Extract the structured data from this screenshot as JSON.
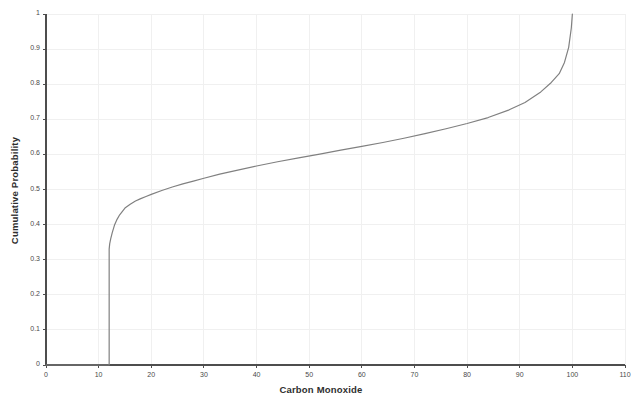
{
  "chart_data": {
    "type": "line",
    "title": "",
    "subtitle": "",
    "xlabel": "Carbon Monoxide",
    "ylabel": "Cumulative Probability",
    "xlim": [
      0,
      110
    ],
    "ylim": [
      0,
      1
    ],
    "xticks": [
      0,
      10,
      20,
      30,
      40,
      50,
      60,
      70,
      80,
      90,
      100,
      110
    ],
    "xticklabels": [
      "0",
      "10",
      "20",
      "30",
      "40",
      "50",
      "60",
      "70",
      "80",
      "90",
      "100",
      "110"
    ],
    "yticks": [
      0,
      0.1,
      0.2,
      0.3,
      0.4,
      0.5,
      0.6,
      0.7,
      0.8,
      0.9,
      1
    ],
    "yticklabels": [
      "0",
      "0.1",
      "0.2",
      "0.3",
      "0.4",
      "0.5",
      "0.6",
      "0.7",
      "0.8",
      "0.9",
      "1"
    ],
    "grid": true,
    "legend": false,
    "legend_position": "none",
    "line_color": "#808080",
    "grid_color": "#f0f0f0",
    "axis_color": "#4d4d4d",
    "background_color": "#ffffff",
    "series": [
      {
        "name": "Carbon Monoxide CDF",
        "x": [
          0,
          6,
          12,
          12,
          12.1,
          12.3,
          12.6,
          13,
          13.5,
          14,
          15,
          16,
          17,
          18,
          19,
          20,
          22,
          24,
          26,
          28,
          30,
          33,
          36,
          40,
          44,
          48,
          52,
          56,
          60,
          64,
          68,
          72,
          76,
          80,
          84,
          88,
          91,
          94,
          96,
          97.5,
          98.5,
          99.3,
          99.8,
          100
        ],
        "y": [
          0,
          0,
          0,
          0.33,
          0.345,
          0.36,
          0.378,
          0.398,
          0.415,
          0.428,
          0.447,
          0.458,
          0.467,
          0.474,
          0.48,
          0.486,
          0.497,
          0.507,
          0.516,
          0.524,
          0.532,
          0.544,
          0.554,
          0.567,
          0.579,
          0.59,
          0.601,
          0.612,
          0.623,
          0.634,
          0.646,
          0.659,
          0.673,
          0.688,
          0.705,
          0.727,
          0.748,
          0.778,
          0.805,
          0.83,
          0.862,
          0.905,
          0.96,
          1.0
        ]
      }
    ],
    "annotations": [
      {
        "text": "vertical jump at x ≈ 12 from 0 to 0.33",
        "x": 12,
        "y": 0.33
      },
      {
        "text": "steep rise to 1 near x ≈ 100",
        "x": 100,
        "y": 1
      }
    ]
  },
  "axes": {
    "x_axis_label": "Carbon Monoxide",
    "y_axis_label": "Cumulative Probability"
  },
  "watermark": {
    "text": ""
  }
}
